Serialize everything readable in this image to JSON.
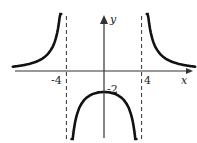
{
  "chart_data": {
    "type": "line",
    "title": "",
    "xlabel": "x",
    "ylabel": "y",
    "xlim": [
      -10,
      10
    ],
    "ylim": [
      -6.5,
      6
    ],
    "grid": false,
    "legend": "none",
    "function_description": "Rational function with vertical asymptotes at x = -4 and x = 4, horizontal asymptote y = 0, local maximum at (0, -2)",
    "vertical_asymptotes": [
      -4,
      4
    ],
    "horizontal_asymptote": 0,
    "tick_labels": {
      "x": [
        "-4",
        "4"
      ],
      "y": [
        "-2"
      ]
    },
    "annotations": [
      {
        "text": "-2",
        "x": 0,
        "y": -2
      }
    ],
    "series": [
      {
        "name": "left-branch",
        "x": [
          -9.7,
          -9,
          -8,
          -7,
          -6,
          -5.5,
          -5,
          -4.7,
          -4.55
        ],
        "y": [
          0.43,
          0.49,
          0.67,
          0.97,
          1.6,
          2.25,
          3.56,
          5.0,
          6.0
        ]
      },
      {
        "name": "middle-branch",
        "x": [
          -3.45,
          -3.2,
          -3,
          -2.5,
          -2,
          -1,
          0,
          1,
          2,
          2.5,
          3,
          3.2,
          3.45
        ],
        "y": [
          -7.8,
          -5.56,
          -4.57,
          -3.28,
          -2.67,
          -2.13,
          -2,
          -2.13,
          -2.67,
          -3.28,
          -4.57,
          -5.56,
          -7.8
        ]
      },
      {
        "name": "right-branch",
        "x": [
          4.55,
          4.7,
          5,
          5.5,
          6,
          7,
          8,
          9,
          9.7
        ],
        "y": [
          6.0,
          5.0,
          3.56,
          2.25,
          1.6,
          0.97,
          0.67,
          0.49,
          0.43
        ]
      }
    ]
  }
}
